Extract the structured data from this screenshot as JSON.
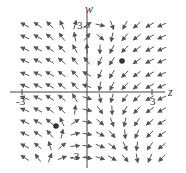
{
  "figure": {
    "type": "direction-field",
    "axes": {
      "horizontal_label": "z",
      "vertical_label": "w",
      "tick_labels": {
        "z_neg": "-3",
        "z_pos": "3",
        "w_pos": "3",
        "w_neg": "-3"
      },
      "origin_px": [
        87,
        92
      ],
      "unit_px": 21.7,
      "range": {
        "z": [
          -3.3,
          3.5
        ],
        "w": [
          -3.5,
          3.5
        ]
      }
    },
    "colors": {
      "arrow": "#555555",
      "axis": "#444444",
      "point": "#333333",
      "text": "#333333"
    },
    "equilibrium_points": [
      {
        "px": [
          122,
          61
        ],
        "approx": [
          1.6,
          1.4
        ]
      },
      {
        "px": [
          56,
          126
        ],
        "approx": [
          -1.4,
          -1.6
        ]
      }
    ],
    "grid": {
      "xs": [
        25,
        38,
        50,
        62,
        75,
        87,
        100,
        112,
        125,
        137,
        150,
        162
      ],
      "ys": [
        25,
        37,
        49,
        61,
        74,
        86,
        98,
        110,
        122,
        134,
        146,
        158
      ]
    }
  },
  "chart_data": {
    "type": "vector-field",
    "title": "",
    "xlabel": "z",
    "ylabel": "w",
    "xlim": [
      -3.3,
      3.5
    ],
    "ylim": [
      -3.5,
      3.5
    ],
    "ticks": {
      "x": [
        -3,
        3
      ],
      "y": [
        -3,
        3
      ]
    },
    "equilibria": [
      [
        1.6,
        1.4
      ],
      [
        -1.4,
        -1.6
      ]
    ]
  }
}
